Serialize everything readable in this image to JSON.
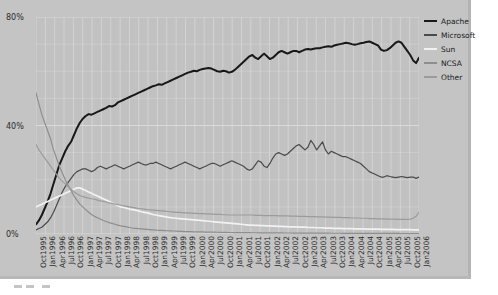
{
  "chart_data": {
    "type": "line",
    "title": "",
    "xlabel": "",
    "ylabel": "",
    "ylim": [
      0,
      80
    ],
    "ytick_labels": [
      "0%",
      "40%",
      "80%"
    ],
    "yticks": [
      0,
      40,
      80
    ],
    "grid": true,
    "legend_position": "right",
    "x_tick_labels": [
      "Oct1995",
      "Jan1996",
      "Apr1996",
      "Jul1996",
      "Oct1996",
      "Jan1997",
      "Apr1997",
      "Jul1997",
      "Oct1997",
      "Jan1998",
      "Apr1998",
      "Jul1998",
      "Oct1998",
      "Jan1999",
      "Apr1999",
      "Jul1999",
      "Oct1999",
      "Jan2000",
      "Apr2000",
      "Jul2000",
      "Oct2000",
      "Jan2001",
      "Apr2001",
      "Jul2001",
      "Oct2001",
      "Jan2002",
      "Apr2002",
      "Jul2002",
      "Oct2002",
      "Jan2003",
      "Apr2003",
      "Jul2003",
      "Oct2003",
      "Jan2004",
      "Apr2004",
      "Jul2004",
      "Oct2004",
      "Jan2005",
      "Apr2005",
      "Jul2005",
      "Oct2005",
      "Jan2006"
    ],
    "x_start": "Oct1995",
    "x_end": "Jan2006",
    "x_step_months": 1,
    "series": [
      {
        "name": "Apache",
        "color": "#181818",
        "values": [
          3.5,
          5.0,
          7.0,
          9.5,
          12.0,
          15.0,
          18.5,
          22.0,
          25.5,
          28.0,
          30.5,
          32.5,
          34.0,
          36.5,
          39.0,
          41.0,
          42.5,
          43.5,
          44.2,
          44.0,
          44.5,
          45.0,
          45.5,
          46.0,
          46.5,
          47.2,
          47.0,
          47.5,
          48.5,
          49.0,
          49.5,
          50.0,
          50.5,
          51.0,
          51.5,
          52.0,
          52.5,
          53.0,
          53.5,
          54.0,
          54.5,
          54.8,
          55.2,
          55.0,
          55.5,
          56.0,
          56.5,
          57.0,
          57.5,
          58.0,
          58.5,
          59.0,
          59.5,
          59.8,
          60.2,
          60.0,
          60.5,
          60.8,
          61.0,
          61.2,
          61.0,
          60.5,
          60.0,
          59.8,
          60.2,
          60.0,
          59.5,
          59.8,
          60.5,
          61.5,
          62.5,
          63.5,
          64.5,
          65.5,
          66.0,
          65.0,
          64.5,
          65.5,
          66.5,
          65.5,
          64.5,
          65.0,
          66.0,
          67.0,
          67.5,
          67.0,
          66.5,
          67.0,
          67.5,
          67.5,
          67.0,
          67.5,
          68.0,
          68.2,
          68.0,
          68.3,
          68.5,
          68.5,
          68.8,
          69.0,
          69.2,
          69.0,
          69.5,
          69.8,
          70.0,
          70.2,
          70.5,
          70.3,
          70.0,
          69.8,
          70.0,
          70.3,
          70.5,
          70.8,
          71.0,
          70.5,
          70.0,
          69.5,
          68.0,
          67.5,
          67.8,
          68.5,
          69.5,
          70.5,
          71.0,
          70.5,
          69.0,
          67.5,
          66.0,
          64.0,
          63.0,
          65.0
        ]
      },
      {
        "name": "Microsoft",
        "color": "#4a4a4a",
        "values": [
          1.5,
          2.0,
          2.5,
          3.5,
          4.5,
          6.0,
          8.0,
          10.5,
          13.0,
          15.5,
          17.5,
          19.0,
          20.5,
          22.0,
          23.0,
          23.5,
          24.0,
          24.0,
          23.5,
          23.0,
          23.5,
          24.5,
          25.0,
          24.5,
          24.0,
          24.5,
          25.0,
          25.5,
          25.0,
          24.5,
          24.0,
          24.5,
          25.0,
          25.5,
          26.0,
          26.5,
          26.0,
          25.5,
          25.5,
          26.0,
          26.0,
          26.5,
          26.0,
          25.5,
          25.0,
          24.5,
          24.0,
          24.5,
          25.0,
          25.5,
          26.0,
          26.5,
          26.0,
          25.5,
          25.0,
          24.5,
          24.0,
          24.5,
          25.0,
          25.5,
          26.0,
          26.0,
          25.5,
          25.0,
          25.5,
          26.0,
          26.5,
          27.0,
          26.5,
          26.0,
          25.5,
          25.0,
          24.0,
          23.5,
          24.0,
          25.5,
          27.0,
          26.5,
          25.0,
          24.5,
          26.0,
          28.0,
          29.5,
          30.0,
          29.5,
          29.0,
          29.5,
          30.5,
          31.5,
          32.5,
          33.0,
          32.0,
          31.0,
          32.0,
          34.5,
          33.0,
          31.0,
          32.5,
          34.0,
          31.0,
          29.5,
          30.5,
          30.0,
          29.5,
          29.0,
          28.5,
          28.5,
          28.0,
          27.5,
          27.0,
          26.5,
          26.0,
          25.0,
          24.0,
          23.0,
          22.5,
          22.0,
          21.5,
          21.0,
          21.0,
          21.5,
          21.2,
          21.0,
          20.8,
          21.0,
          21.2,
          21.0,
          20.8,
          21.0,
          21.0,
          20.5,
          21.0
        ]
      },
      {
        "name": "Sun",
        "color": "#f2f2f2",
        "values": [
          10.0,
          10.5,
          11.0,
          11.5,
          12.0,
          12.5,
          13.0,
          13.5,
          14.0,
          14.5,
          15.0,
          15.5,
          16.0,
          16.5,
          17.0,
          17.0,
          16.5,
          16.0,
          15.5,
          15.0,
          14.5,
          14.0,
          13.5,
          13.0,
          12.5,
          12.0,
          11.5,
          11.0,
          10.5,
          10.0,
          9.8,
          9.5,
          9.2,
          9.0,
          8.8,
          8.5,
          8.2,
          8.0,
          7.8,
          7.5,
          7.2,
          7.0,
          6.8,
          6.6,
          6.4,
          6.2,
          6.0,
          5.9,
          5.8,
          5.7,
          5.6,
          5.5,
          5.4,
          5.3,
          5.2,
          5.1,
          5.0,
          4.9,
          4.8,
          4.7,
          4.6,
          4.5,
          4.4,
          4.3,
          4.2,
          4.1,
          4.0,
          3.9,
          3.8,
          3.7,
          3.6,
          3.5,
          3.4,
          3.3,
          3.3,
          3.2,
          3.2,
          3.1,
          3.1,
          3.0,
          3.0,
          2.9,
          2.9,
          2.8,
          2.8,
          2.7,
          2.7,
          2.6,
          2.6,
          2.6,
          2.5,
          2.5,
          2.5,
          2.4,
          2.4,
          2.4,
          2.3,
          2.3,
          2.3,
          2.2,
          2.2,
          2.2,
          2.1,
          2.1,
          2.1,
          2.0,
          2.0,
          2.0,
          2.0,
          1.9,
          1.9,
          1.9,
          1.9,
          1.8,
          1.8,
          1.8,
          1.8,
          1.8,
          1.7,
          1.7,
          1.7,
          1.7,
          1.7,
          1.6,
          1.6,
          1.6,
          1.6,
          1.6,
          1.6,
          1.5,
          1.5,
          1.5
        ]
      },
      {
        "name": "NCSA",
        "color": "#8e8e8e",
        "values": [
          52.0,
          48.0,
          44.0,
          41.0,
          38.0,
          35.0,
          31.0,
          28.0,
          25.0,
          22.5,
          20.0,
          18.0,
          16.0,
          14.0,
          12.5,
          11.0,
          10.0,
          9.0,
          8.0,
          7.2,
          6.5,
          6.0,
          5.5,
          5.0,
          4.6,
          4.2,
          3.9,
          3.6,
          3.3,
          3.0,
          2.8,
          2.6,
          2.4,
          2.2,
          2.1,
          2.0,
          1.9,
          1.8,
          1.7,
          1.6,
          1.5,
          1.4,
          1.35,
          1.3,
          1.25,
          1.2,
          1.15,
          1.1,
          1.05,
          1.0,
          0.95,
          0.9,
          0.88,
          0.85,
          0.82,
          0.8,
          0.78,
          0.75,
          0.72,
          0.7,
          0.68,
          0.66,
          0.64,
          0.62,
          0.6,
          0.58,
          0.56,
          0.55,
          0.54,
          0.53,
          0.52,
          0.5,
          0.5,
          0.48,
          0.47,
          0.46,
          0.45,
          0.44,
          0.43,
          0.42,
          0.41,
          0.4,
          0.4,
          0.39,
          0.38,
          0.37,
          0.36,
          0.36,
          0.35,
          0.35,
          0.34,
          0.33,
          0.33,
          0.32,
          0.32,
          0.31,
          0.3,
          0.3,
          0.3,
          0.29,
          0.29,
          0.28,
          0.28,
          0.27,
          0.27,
          0.26,
          0.26,
          0.25,
          0.25,
          0.25,
          0.24,
          0.24,
          0.24,
          0.23,
          0.23,
          0.22,
          0.22,
          0.22,
          0.21,
          0.21,
          0.21,
          0.2,
          0.2,
          0.2,
          0.2,
          0.19,
          0.19,
          0.19,
          0.18,
          0.18,
          0.18,
          0.18
        ]
      },
      {
        "name": "Other",
        "color": "#9b9b9b",
        "values": [
          33.0,
          31.0,
          29.5,
          28.0,
          26.5,
          25.0,
          23.5,
          22.0,
          20.5,
          19.5,
          18.5,
          17.5,
          16.5,
          15.5,
          14.8,
          14.2,
          13.8,
          13.5,
          13.2,
          13.0,
          12.8,
          12.5,
          12.2,
          12.0,
          11.8,
          11.5,
          11.3,
          11.0,
          10.8,
          10.6,
          10.4,
          10.2,
          10.0,
          9.8,
          9.6,
          9.4,
          9.3,
          9.2,
          9.0,
          8.9,
          8.8,
          8.7,
          8.6,
          8.5,
          8.4,
          8.3,
          8.2,
          8.1,
          8.0,
          8.0,
          7.9,
          7.8,
          7.8,
          7.7,
          7.6,
          7.6,
          7.5,
          7.5,
          7.4,
          7.4,
          7.3,
          7.3,
          7.2,
          7.2,
          7.1,
          7.1,
          7.0,
          7.0,
          7.0,
          7.0,
          7.0,
          7.0,
          7.0,
          7.0,
          7.0,
          6.9,
          6.9,
          6.9,
          6.8,
          6.8,
          6.8,
          6.8,
          6.8,
          6.7,
          6.7,
          6.7,
          6.7,
          6.6,
          6.6,
          6.6,
          6.5,
          6.5,
          6.5,
          6.4,
          6.4,
          6.4,
          6.3,
          6.3,
          6.3,
          6.2,
          6.2,
          6.2,
          6.1,
          6.1,
          6.1,
          6.0,
          6.0,
          6.0,
          5.9,
          5.9,
          5.9,
          5.8,
          5.8,
          5.8,
          5.7,
          5.7,
          5.7,
          5.6,
          5.6,
          5.6,
          5.5,
          5.5,
          5.5,
          5.5,
          5.4,
          5.4,
          5.4,
          5.4,
          5.5,
          5.8,
          6.5,
          8.0
        ]
      }
    ]
  },
  "legend": {
    "items": [
      {
        "label": "Apache",
        "color": "#181818"
      },
      {
        "label": "Microsoft",
        "color": "#4a4a4a"
      },
      {
        "label": "Sun",
        "color": "#f2f2f2"
      },
      {
        "label": "NCSA",
        "color": "#8e8e8e"
      },
      {
        "label": "Other",
        "color": "#9b9b9b"
      }
    ]
  },
  "colors": {
    "canvas_background": "#c4c4c4",
    "plot_background": "#c1c1c1",
    "gridline": "#dcdcdc",
    "axis_text": "#2b2b2b",
    "page_background": "#ffffff"
  }
}
